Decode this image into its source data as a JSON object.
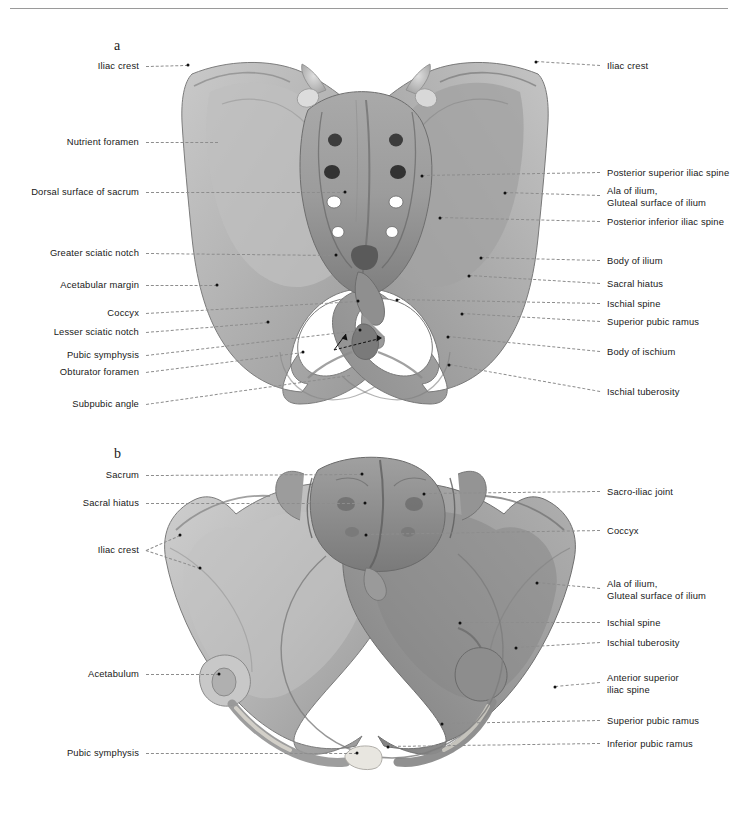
{
  "figure": {
    "background_color": "#ffffff",
    "rule_color": "#9a9a9a",
    "bone_color": "#b5b5b5",
    "bone_shadow_color": "#8a8a8a",
    "bone_highlight_color": "#d2d2d2",
    "cartilage_color": "#e8e6e0",
    "leader_color": "#8d8d8d",
    "dot_color": "#111111",
    "text_color": "#202020"
  },
  "panels": [
    {
      "id": "a",
      "letter": "a",
      "caption": "a",
      "view": "posterior view of the pelvis"
    },
    {
      "id": "b",
      "letter": "b",
      "caption": "b",
      "view": "superior view of the pelvic inlet"
    }
  ],
  "panel_a": {
    "left_labels": [
      {
        "text": "Iliac crest",
        "y": 66,
        "tx": 188,
        "ty": 65,
        "dot": true
      },
      {
        "text": "Nutrient foramen",
        "y": 142,
        "tx": 218,
        "ty": 142,
        "dot": false
      },
      {
        "text": "Dorsal surface of sacrum",
        "y": 192,
        "tx": 345,
        "ty": 192,
        "dot": true
      },
      {
        "text": "Greater sciatic notch",
        "y": 253,
        "tx": 336,
        "ty": 255,
        "dot": true
      },
      {
        "text": "Acetabular margin",
        "y": 285,
        "tx": 217,
        "ty": 285,
        "dot": true
      },
      {
        "text": "Coccyx",
        "y": 313,
        "tx": 358,
        "ty": 301,
        "dot": true
      },
      {
        "text": "Lesser sciatic notch",
        "y": 332,
        "tx": 268,
        "ty": 322,
        "dot": true
      },
      {
        "text": "Pubic symphysis",
        "y": 355,
        "tx": 360,
        "ty": 330,
        "dot": true
      },
      {
        "text": "Obturator foramen",
        "y": 372,
        "tx": 303,
        "ty": 352,
        "dot": true
      },
      {
        "text": "Subpubic angle",
        "y": 404,
        "tx": 350,
        "ty": 375,
        "dot": false
      }
    ],
    "right_labels": [
      {
        "text": "Iliac crest",
        "y": 66,
        "tx": 536,
        "ty": 62,
        "dot": true
      },
      {
        "text": "Posterior superior iliac spine",
        "y": 173,
        "tx": 422,
        "ty": 176,
        "dot": true
      },
      {
        "text": "Ala of ilium,\nGluteal surface of ilium",
        "y": 196,
        "tx": 505,
        "ty": 193,
        "dot": true
      },
      {
        "text": "Posterior inferior iliac spine",
        "y": 222,
        "tx": 440,
        "ty": 218,
        "dot": true
      },
      {
        "text": "Body of ilium",
        "y": 261,
        "tx": 481,
        "ty": 258,
        "dot": true
      },
      {
        "text": "Sacral hiatus",
        "y": 284,
        "tx": 469,
        "ty": 276,
        "dot": true
      },
      {
        "text": "Ischial spine",
        "y": 304,
        "tx": 397,
        "ty": 300,
        "dot": true
      },
      {
        "text": "Superior pubic ramus",
        "y": 322,
        "tx": 462,
        "ty": 314,
        "dot": true
      },
      {
        "text": "Body of ischium",
        "y": 352,
        "tx": 448,
        "ty": 337,
        "dot": true
      },
      {
        "text": "Ischial tuberosity",
        "y": 392,
        "tx": 449,
        "ty": 365,
        "dot": true
      }
    ]
  },
  "panel_b": {
    "left_labels": [
      {
        "text": "Sacrum",
        "y": 475,
        "tx": 362,
        "ty": 474,
        "dot": true
      },
      {
        "text": "Sacral hiatus",
        "y": 503,
        "tx": 365,
        "ty": 503,
        "dot": true
      },
      {
        "text": "Iliac crest",
        "y": 550,
        "tx": 180,
        "ty": 535,
        "dot": true,
        "fork_tx": 200,
        "fork_ty": 568
      },
      {
        "text": "Acetabulum",
        "y": 674,
        "tx": 219,
        "ty": 674,
        "dot": true
      },
      {
        "text": "Pubic symphysis",
        "y": 753,
        "tx": 357,
        "ty": 753,
        "dot": true
      }
    ],
    "right_labels": [
      {
        "text": "Sacro-iliac joint",
        "y": 492,
        "tx": 424,
        "ty": 494,
        "dot": true
      },
      {
        "text": "Coccyx",
        "y": 531,
        "tx": 366,
        "ty": 535,
        "dot": true
      },
      {
        "text": "Ala of ilium,\nGluteal surface of ilium",
        "y": 589,
        "tx": 537,
        "ty": 583,
        "dot": true
      },
      {
        "text": "Ischial spine",
        "y": 623,
        "tx": 460,
        "ty": 623,
        "dot": true
      },
      {
        "text": "Ischial tuberosity",
        "y": 643,
        "tx": 516,
        "ty": 648,
        "dot": true
      },
      {
        "text": "Anterior superior\niliac spine",
        "y": 683,
        "tx": 555,
        "ty": 687,
        "dot": true
      },
      {
        "text": "Superior pubic ramus",
        "y": 721,
        "tx": 442,
        "ty": 724,
        "dot": true
      },
      {
        "text": "Inferior pubic ramus",
        "y": 744,
        "tx": 388,
        "ty": 747,
        "dot": true
      }
    ]
  },
  "layout": {
    "left_label_right_edge": 139,
    "right_label_left_edge": 607,
    "panel_a_letter_x": 114,
    "panel_a_letter_y": 38,
    "panel_b_letter_x": 114,
    "panel_b_letter_y": 446
  }
}
